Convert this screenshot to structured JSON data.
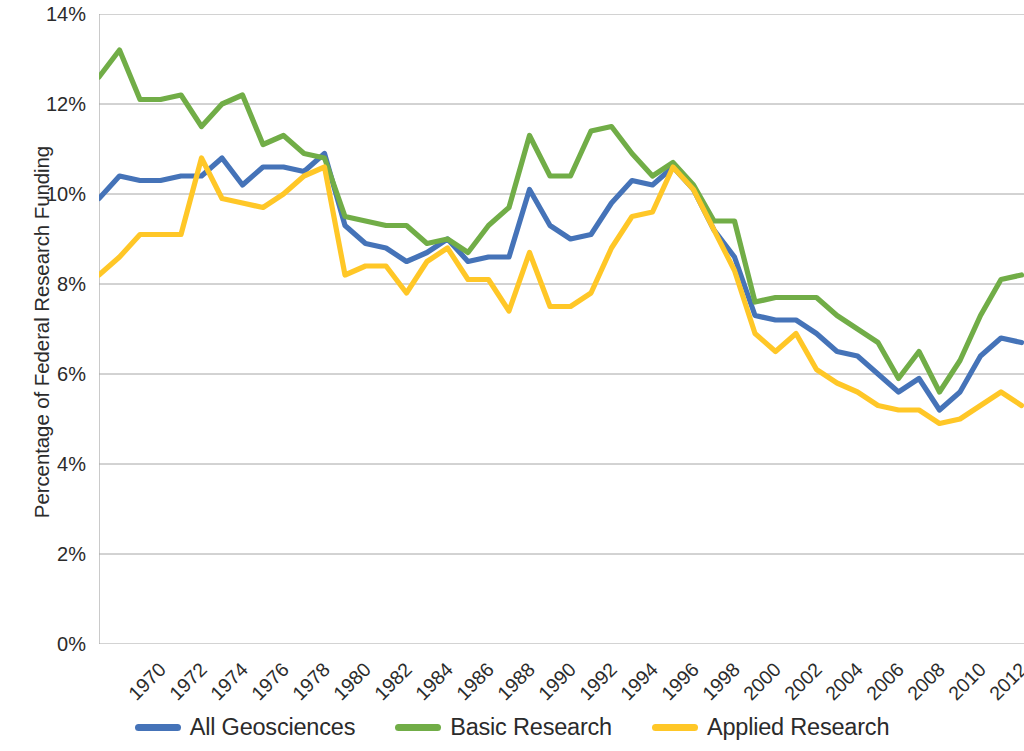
{
  "chart_data": {
    "type": "line",
    "title": "",
    "xlabel": "",
    "ylabel": "Percentage of Federal Research Funding",
    "ylim": [
      0,
      14
    ],
    "ytick_labels": [
      "14%",
      "12%",
      "10%",
      "8%",
      "6%",
      "4%",
      "2%",
      "0%"
    ],
    "ytick_values": [
      14,
      12,
      10,
      8,
      6,
      4,
      2,
      0
    ],
    "grid": "horizontal",
    "legend_position": "bottom",
    "x": [
      1970,
      1971,
      1972,
      1973,
      1974,
      1975,
      1976,
      1977,
      1978,
      1979,
      1980,
      1981,
      1982,
      1983,
      1984,
      1985,
      1986,
      1987,
      1988,
      1989,
      1990,
      1991,
      1992,
      1993,
      1994,
      1995,
      1996,
      1997,
      1998,
      1999,
      2000,
      2001,
      2002,
      2003,
      2004,
      2005,
      2006,
      2007,
      2008,
      2009,
      2010,
      2011,
      2012,
      2013,
      2014,
      2015
    ],
    "xtick_labels": [
      "1970",
      "1972",
      "1974",
      "1976",
      "1978",
      "1980",
      "1982",
      "1984",
      "1986",
      "1988",
      "1990",
      "1992",
      "1994",
      "1996",
      "1998",
      "2000",
      "2002",
      "2004",
      "2006",
      "2008",
      "2010",
      "2012",
      "2014"
    ],
    "series": [
      {
        "name": "All Geosciences",
        "color": "#4573B8",
        "values": [
          9.9,
          10.4,
          10.3,
          10.3,
          10.4,
          10.4,
          10.8,
          10.2,
          10.6,
          10.6,
          10.5,
          10.9,
          9.3,
          8.9,
          8.8,
          8.5,
          8.7,
          9.0,
          8.5,
          8.6,
          8.6,
          10.1,
          9.3,
          9.0,
          9.1,
          9.8,
          10.3,
          10.2,
          10.6,
          10.1,
          9.2,
          8.6,
          7.3,
          7.2,
          7.2,
          6.9,
          6.5,
          6.4,
          6.0,
          5.6,
          5.9,
          5.2,
          5.6,
          6.4,
          6.8,
          6.7
        ]
      },
      {
        "name": "Basic Research",
        "color": "#71AD47",
        "values": [
          12.6,
          13.2,
          12.1,
          12.1,
          12.2,
          11.5,
          12.0,
          12.2,
          11.1,
          11.3,
          10.9,
          10.8,
          9.5,
          9.4,
          9.3,
          9.3,
          8.9,
          9.0,
          8.7,
          9.3,
          9.7,
          11.3,
          10.4,
          10.4,
          11.4,
          11.5,
          10.9,
          10.4,
          10.7,
          10.2,
          9.4,
          9.4,
          7.6,
          7.7,
          7.7,
          7.7,
          7.3,
          7.0,
          6.7,
          5.9,
          6.5,
          5.6,
          6.3,
          7.3,
          8.1,
          8.2
        ]
      },
      {
        "name": "Applied Research",
        "color": "#FFC727",
        "values": [
          8.2,
          8.6,
          9.1,
          9.1,
          9.1,
          10.8,
          9.9,
          9.8,
          9.7,
          10.0,
          10.4,
          10.6,
          8.2,
          8.4,
          8.4,
          7.8,
          8.5,
          8.8,
          8.1,
          8.1,
          7.4,
          8.7,
          7.5,
          7.5,
          7.8,
          8.8,
          9.5,
          9.6,
          10.6,
          10.1,
          9.2,
          8.3,
          6.9,
          6.5,
          6.9,
          6.1,
          5.8,
          5.6,
          5.3,
          5.2,
          5.2,
          4.9,
          5.0,
          5.3,
          5.6,
          5.3
        ]
      }
    ]
  },
  "legend": {
    "items": [
      {
        "label": "All Geosciences",
        "color": "#4573B8"
      },
      {
        "label": "Basic Research",
        "color": "#71AD47"
      },
      {
        "label": "Applied Research",
        "color": "#FFC727"
      }
    ]
  },
  "axis": {
    "y_title": "Percentage of Federal Research Funding"
  }
}
